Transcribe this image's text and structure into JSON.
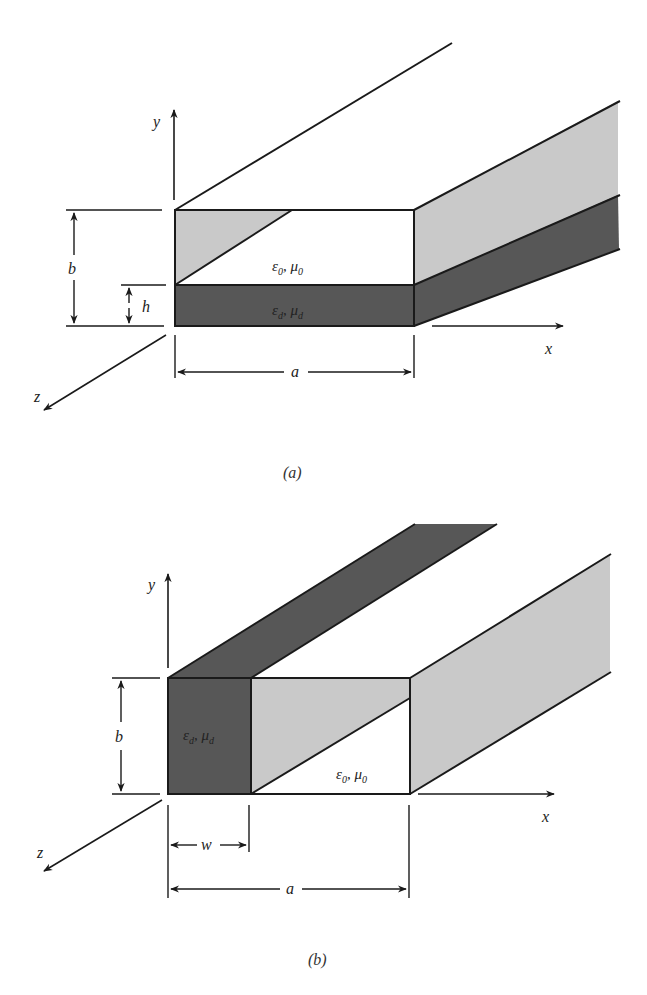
{
  "colors": {
    "line": "#1a1a1a",
    "light_fill": "#c9c9c9",
    "dark_fill": "#575757",
    "background": "#ffffff"
  },
  "figure_a": {
    "caption": "(a)",
    "axes": {
      "x": "x",
      "y": "y",
      "z": "z"
    },
    "dimensions": {
      "width": "a",
      "height": "b",
      "slab_height": "h"
    },
    "regions": {
      "upper": {
        "eps": "ε",
        "eps_sub": "0",
        "mu": "μ",
        "mu_sub": "0",
        "sep": ", "
      },
      "lower": {
        "eps": "ε",
        "eps_sub": "d",
        "mu": "μ",
        "mu_sub": "d",
        "sep": ", "
      }
    },
    "description": "Rectangular waveguide partially filled with a horizontal dielectric slab of height h"
  },
  "figure_b": {
    "caption": "(b)",
    "axes": {
      "x": "x",
      "y": "y",
      "z": "z"
    },
    "dimensions": {
      "width": "a",
      "height": "b",
      "slab_width": "w"
    },
    "regions": {
      "left": {
        "eps": "ε",
        "eps_sub": "d",
        "mu": "μ",
        "mu_sub": "d",
        "sep": ", "
      },
      "right": {
        "eps": "ε",
        "eps_sub": "0",
        "mu": "μ",
        "mu_sub": "0",
        "sep": ", "
      }
    },
    "description": "Rectangular waveguide partially filled with a vertical dielectric slab of width w"
  }
}
